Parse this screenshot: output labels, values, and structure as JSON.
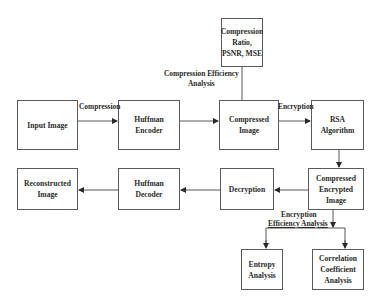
{
  "diagram": {
    "nodes": {
      "metrics": "Compression Ratio, PSNR, MSE",
      "input_image": "Input Image",
      "huffman_encoder": "Huffman Encoder",
      "compressed_image": "Compressed Image",
      "rsa_algorithm": "RSA Algorithm",
      "compressed_encrypted_image": "Compressed Encrypted Image",
      "decryption": "Decryption",
      "huffman_decoder": "Huffman Decoder",
      "reconstructed_image": "Reconstructed Image",
      "entropy_analysis": "Entropy Analysis",
      "correlation_analysis": "Correlation Coefficient Analysis"
    },
    "edge_labels": {
      "compression": "Compression",
      "encryption": "Encryption",
      "compression_efficiency_line1": "Compression Efficiency",
      "compression_efficiency_line2": "Analysis",
      "encryption_efficiency_line1": "Encryption",
      "encryption_efficiency_line2": "Efficiency Analysis"
    },
    "edges": [
      {
        "from": "input_image",
        "to": "huffman_encoder",
        "label": "Compression"
      },
      {
        "from": "huffman_encoder",
        "to": "compressed_image"
      },
      {
        "from": "compressed_image",
        "to": "metrics",
        "label": "Compression Efficiency Analysis"
      },
      {
        "from": "compressed_image",
        "to": "rsa_algorithm",
        "label": "Encryption"
      },
      {
        "from": "rsa_algorithm",
        "to": "compressed_encrypted_image"
      },
      {
        "from": "compressed_encrypted_image",
        "to": "decryption"
      },
      {
        "from": "decryption",
        "to": "huffman_decoder"
      },
      {
        "from": "huffman_decoder",
        "to": "reconstructed_image"
      },
      {
        "from": "compressed_encrypted_image",
        "to": "entropy_analysis",
        "label": "Encryption Efficiency Analysis"
      },
      {
        "from": "compressed_encrypted_image",
        "to": "correlation_analysis",
        "label": "Encryption Efficiency Analysis"
      }
    ]
  }
}
